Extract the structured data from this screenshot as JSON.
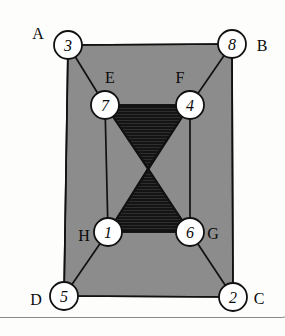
{
  "figure": {
    "colors": {
      "background": "#fdfdfc",
      "region_fill": "#8c8c8c",
      "hatch_fill": "#1a1a1a",
      "edge_stroke": "#111111",
      "node_fill": "#ffffff",
      "node_stroke": "#111111",
      "card_border": "#8a8a8a"
    },
    "nodes": [
      {
        "id": "n3",
        "label": "3",
        "cx": 68,
        "cy": 45,
        "r": 14
      },
      {
        "id": "n8",
        "label": "8",
        "cx": 232,
        "cy": 44,
        "r": 14
      },
      {
        "id": "n7",
        "label": "7",
        "cx": 105,
        "cy": 105,
        "r": 14
      },
      {
        "id": "n4",
        "label": "4",
        "cx": 190,
        "cy": 105,
        "r": 14
      },
      {
        "id": "n1",
        "label": "1",
        "cx": 108,
        "cy": 232,
        "r": 14
      },
      {
        "id": "n6",
        "label": "6",
        "cx": 190,
        "cy": 232,
        "r": 14
      },
      {
        "id": "n5",
        "label": "5",
        "cx": 64,
        "cy": 296,
        "r": 14
      },
      {
        "id": "n2",
        "label": "2",
        "cx": 233,
        "cy": 297,
        "r": 14
      }
    ],
    "corner_labels": [
      {
        "id": "A",
        "label": "A",
        "x": 38,
        "y": 34
      },
      {
        "id": "B",
        "label": "B",
        "x": 262,
        "y": 46
      },
      {
        "id": "C",
        "label": "C",
        "x": 259,
        "y": 299
      },
      {
        "id": "D",
        "label": "D",
        "x": 36,
        "y": 300
      },
      {
        "id": "E",
        "label": "E",
        "x": 110,
        "y": 78
      },
      {
        "id": "F",
        "label": "F",
        "x": 180,
        "y": 78
      },
      {
        "id": "G",
        "label": "G",
        "x": 213,
        "y": 234
      },
      {
        "id": "H",
        "label": "H",
        "x": 84,
        "y": 236
      }
    ],
    "edges": [
      {
        "from": "n3",
        "to": "n8"
      },
      {
        "from": "n3",
        "to": "n5"
      },
      {
        "from": "n3",
        "to": "n7"
      },
      {
        "from": "n8",
        "to": "n2"
      },
      {
        "from": "n8",
        "to": "n4"
      },
      {
        "from": "n7",
        "to": "n4"
      },
      {
        "from": "n7",
        "to": "n1"
      },
      {
        "from": "n4",
        "to": "n6"
      },
      {
        "from": "n1",
        "to": "n6"
      },
      {
        "from": "n1",
        "to": "n5"
      },
      {
        "from": "n6",
        "to": "n2"
      },
      {
        "from": "n5",
        "to": "n2"
      },
      {
        "from": "n7",
        "to": "n6"
      },
      {
        "from": "n4",
        "to": "n1"
      }
    ],
    "region_polygon": "68,45 232,44 233,297 64,296",
    "hatched_regions": [
      {
        "id": "upper-triangle",
        "points": "105,105 190,105 148,168"
      },
      {
        "id": "lower-triangle",
        "points": "108,232 190,232 148,168"
      }
    ]
  }
}
